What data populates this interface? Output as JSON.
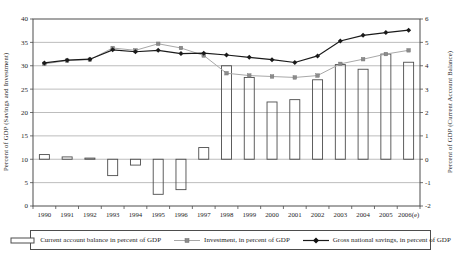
{
  "chart_data": {
    "type": "combo-bar-line",
    "categories": [
      "1990",
      "1991",
      "1992",
      "1993",
      "1994",
      "1995",
      "1996",
      "1997",
      "1998",
      "1999",
      "2000",
      "2001",
      "2002",
      "2003",
      "2004",
      "2005",
      "2006(e)"
    ],
    "series": [
      {
        "name": "Current account balance in percent of GDP",
        "type": "bar",
        "axis": "right",
        "values": [
          0.2,
          0.1,
          0.05,
          -0.7,
          -0.25,
          -1.5,
          -1.3,
          0.5,
          4.0,
          3.5,
          2.45,
          2.55,
          3.4,
          4.05,
          3.85,
          4.5,
          4.15
        ]
      },
      {
        "name": "Investment, in percent of GDP",
        "type": "line",
        "marker": "square",
        "axis": "left",
        "values": [
          30.4,
          31.1,
          31.3,
          33.8,
          33.3,
          34.7,
          33.8,
          32.2,
          28.4,
          27.9,
          27.7,
          27.5,
          27.9,
          30.4,
          31.4,
          32.5,
          33.3
        ]
      },
      {
        "name": "Gross national savings, in percent of GDP",
        "type": "line",
        "marker": "diamond",
        "axis": "left",
        "values": [
          30.6,
          31.2,
          31.4,
          33.4,
          33.0,
          33.3,
          32.6,
          32.7,
          32.3,
          31.8,
          31.3,
          30.7,
          32.1,
          35.3,
          36.5,
          37.1,
          37.6
        ]
      }
    ],
    "left_axis": {
      "title": "Percent of GDP (Savings and Investment)",
      "min": 0,
      "max": 40,
      "step": 5,
      "tick_labels": [
        "40",
        "35",
        "30",
        "25",
        "20",
        "15",
        "10",
        "5",
        "0"
      ]
    },
    "right_axis": {
      "title": "Percent of GDP (Current Account Balance)",
      "min": -2,
      "max": 6,
      "step": 1,
      "tick_labels": [
        "6",
        "5",
        "4",
        "3",
        "2",
        "1",
        "0",
        "-1",
        "-2"
      ]
    },
    "grid": true,
    "legend_position": "bottom",
    "colors": {
      "bar_outline": "#4d4d4d",
      "investment_line": "#a8a8a8",
      "investment_marker": "#8c8c8c",
      "savings_line": "#1a1a1a",
      "gridline": "#909090",
      "frame": "#4d4d4d",
      "text": "#262626"
    }
  }
}
